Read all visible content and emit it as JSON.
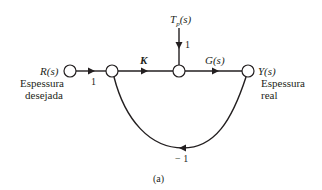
{
  "diagram": {
    "type": "signal-flow-graph",
    "caption": "(a)",
    "nodes": {
      "input": {
        "label": "R(s)",
        "desc_line1": "Espessura",
        "desc_line2": "desejada"
      },
      "sum": {
        "label": ""
      },
      "disturbance_node": {
        "label": ""
      },
      "output": {
        "label": "Y(s)",
        "desc_line1": "Espessura",
        "desc_line2": "real"
      },
      "disturbance": {
        "label_main": "T",
        "label_sub": "p",
        "label_tail": "(s)"
      }
    },
    "branches": {
      "input_gain": "1",
      "controller": "K",
      "plant": "G(s)",
      "disturbance_gain": "1",
      "feedback": "− 1"
    },
    "colors": {
      "line": "#231f20",
      "background": "#ffffff"
    }
  }
}
